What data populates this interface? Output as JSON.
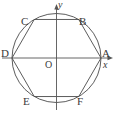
{
  "figure": {
    "stroke_color": "#4a4a4a",
    "axis_color": "#555555",
    "background_color": "#ffffff",
    "text_color": "#3a3a3a"
  },
  "axes": {
    "x_label": "x",
    "y_label": "y",
    "origin_label": "O",
    "origin_px": {
      "x": 56.5,
      "y": 58
    },
    "x_axis": {
      "from_px": 2,
      "to_px": 112,
      "y_px": 58,
      "has_arrow": true
    },
    "y_axis": {
      "from_px": 108,
      "to_px": 6,
      "x_px": 56.5,
      "has_arrow": true
    }
  },
  "circle": {
    "center_px": {
      "x": 56.5,
      "y": 58
    },
    "radius_px": 44.5
  },
  "hexagon": {
    "vertex_order": [
      "A",
      "B",
      "C",
      "D",
      "E",
      "F"
    ],
    "vertices": [
      {
        "label": "A",
        "angle_deg": 0,
        "x_px": 101.0,
        "y_px": 58.0
      },
      {
        "label": "B",
        "angle_deg": 60,
        "x_px": 78.75,
        "y_px": 19.46
      },
      {
        "label": "C",
        "angle_deg": 120,
        "x_px": 34.25,
        "y_px": 19.46
      },
      {
        "label": "D",
        "angle_deg": 180,
        "x_px": 12.0,
        "y_px": 58.0
      },
      {
        "label": "E",
        "angle_deg": 240,
        "x_px": 34.25,
        "y_px": 96.54
      },
      {
        "label": "F",
        "angle_deg": 300,
        "x_px": 78.75,
        "y_px": 96.54
      }
    ]
  }
}
